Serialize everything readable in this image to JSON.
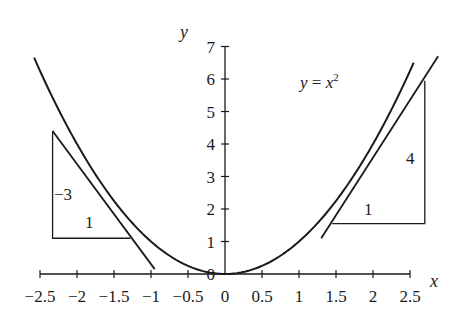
{
  "chart_data": {
    "type": "line",
    "title": "",
    "xlabel": "x",
    "ylabel": "y",
    "xlim": [
      -2.5,
      2.5
    ],
    "ylim": [
      0,
      7
    ],
    "grid": false,
    "x_ticks": [
      -2.5,
      -2,
      -1.5,
      -1,
      -0.5,
      0,
      0.5,
      1,
      1.5,
      2,
      2.5
    ],
    "x_tick_labels": [
      "−2.5",
      "−2",
      "−1.5",
      "−1",
      "−0.5",
      "0",
      "0.5",
      "1",
      "1.5",
      "2",
      "2.5"
    ],
    "y_ticks": [
      0,
      1,
      2,
      3,
      4,
      5,
      6,
      7
    ],
    "y_tick_labels": [
      "0",
      "1",
      "2",
      "3",
      "4",
      "5",
      "6",
      "7"
    ],
    "series": [
      {
        "name": "y = x^2",
        "kind": "curve",
        "function": "x^2",
        "x_range": [
          -2.58,
          2.55
        ]
      },
      {
        "name": "tangent at x = -1.5 (slope -3)",
        "kind": "line",
        "x": [
          -2.33,
          -0.95
        ],
        "y": [
          4.4,
          0.15
        ]
      },
      {
        "name": "tangent at x = 2 (slope 4)",
        "kind": "line",
        "x": [
          1.3,
          2.88
        ],
        "y": [
          1.1,
          6.7
        ]
      }
    ],
    "slope_triangles": [
      {
        "name": "left-slope-triangle",
        "points": [
          [
            -2.33,
            4.4
          ],
          [
            -2.33,
            1.1
          ],
          [
            -1.28,
            1.1
          ]
        ],
        "rise_label": "−3",
        "run_label": "1"
      },
      {
        "name": "right-slope-triangle",
        "points": [
          [
            1.45,
            1.55
          ],
          [
            2.7,
            1.55
          ],
          [
            2.7,
            5.95
          ]
        ],
        "rise_label": "4",
        "run_label": "1"
      }
    ],
    "annotations": [
      {
        "text": "y = x²",
        "x": 1.25,
        "y": 5.8
      }
    ],
    "legend": "none"
  },
  "labels": {
    "x_axis": "x",
    "y_axis": "y",
    "equation_y": "y",
    "equation_eq": " = ",
    "equation_x": "x",
    "equation_exp": "2",
    "left_rise": "−3",
    "left_run": "1",
    "right_rise": "4",
    "right_run": "1"
  },
  "colors": {
    "ink": "#1a1a1a",
    "background": "#ffffff"
  }
}
